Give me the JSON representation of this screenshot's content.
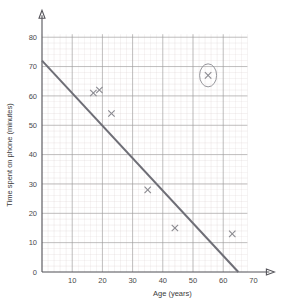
{
  "chart_data": {
    "type": "scatter",
    "title": "",
    "xlabel": "Age (years)",
    "ylabel": "Time spent on phone (minutes)",
    "xlim": [
      0,
      70
    ],
    "ylim": [
      0,
      80
    ],
    "xticks": [
      10,
      20,
      30,
      40,
      50,
      60,
      70
    ],
    "yticks": [
      10,
      20,
      30,
      40,
      50,
      60,
      70,
      80
    ],
    "xtick_labels": [
      "10",
      "20",
      "30",
      "40",
      "50",
      "60",
      "70"
    ],
    "ytick_labels": [
      "10",
      "20",
      "30",
      "40",
      "50",
      "60",
      "70",
      "80"
    ],
    "grid": true,
    "grid_major_step_x": 10,
    "grid_major_step_y": 10,
    "grid_minor_step_x": 2,
    "grid_minor_step_y": 2,
    "legend": "none",
    "marker": "x",
    "points": [
      {
        "x": 17,
        "y": 61,
        "circled": false
      },
      {
        "x": 19,
        "y": 62,
        "circled": false
      },
      {
        "x": 23,
        "y": 54,
        "circled": false
      },
      {
        "x": 35,
        "y": 28,
        "circled": false
      },
      {
        "x": 44,
        "y": 15,
        "circled": false
      },
      {
        "x": 55,
        "y": 67,
        "circled": true
      },
      {
        "x": 63,
        "y": 13,
        "circled": false
      }
    ],
    "series": [
      {
        "name": "Age vs time spent on phone",
        "x": [
          17,
          19,
          23,
          35,
          44,
          55,
          63
        ],
        "values": [
          61,
          62,
          54,
          28,
          15,
          67,
          13
        ]
      }
    ],
    "trend_line": {
      "name": "line of best fit",
      "x0": 0,
      "y0": 72,
      "x1": 65,
      "y1": 0
    },
    "annotations": [
      {
        "kind": "ellipse-highlight",
        "target_x": 55,
        "target_y": 67,
        "label": ""
      }
    ],
    "colors": {
      "grid_minor": "#d9cfcf",
      "grid_major": "#9b9b9b",
      "axis": "#55545a",
      "trend_line": "#6e6e76",
      "marker": "#8a8a90",
      "text": "#3a3a3a",
      "background": "#ffffff"
    }
  }
}
